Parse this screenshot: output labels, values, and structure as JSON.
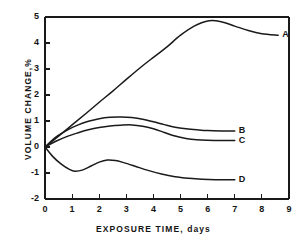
{
  "chart_data": {
    "type": "line",
    "title": "",
    "xlabel": "EXPOSURE TIME, days",
    "ylabel": "VOLUME CHANGE,%",
    "xlim": [
      0,
      9
    ],
    "ylim": [
      -2,
      5
    ],
    "xticks": [
      "0",
      "1",
      "2",
      "3",
      "4",
      "5",
      "6",
      "7",
      "8",
      "9"
    ],
    "yticks": [
      "-2",
      "-1",
      "0",
      "1",
      "2",
      "3",
      "4",
      "5"
    ],
    "grid": false,
    "legend_position": "inline-right-end-labels",
    "line_color": "#1a1a1a",
    "axis_color": "#1a1a1a",
    "series": [
      {
        "name": "A",
        "label": "A",
        "x": [
          0,
          0.5,
          1,
          1.5,
          2,
          2.5,
          3,
          3.5,
          4,
          4.5,
          5,
          5.5,
          6,
          6.5,
          7,
          7.5,
          8,
          8.6
        ],
        "values": [
          0,
          0.42,
          0.85,
          1.28,
          1.72,
          2.15,
          2.6,
          3.04,
          3.45,
          3.85,
          4.3,
          4.65,
          4.85,
          4.82,
          4.65,
          4.48,
          4.36,
          4.3
        ]
      },
      {
        "name": "B",
        "label": "B",
        "x": [
          0,
          0.4,
          0.8,
          1.2,
          1.6,
          2,
          2.4,
          2.8,
          3.2,
          3.6,
          4,
          4.4,
          4.8,
          5.2,
          5.6,
          6,
          6.5,
          7
        ],
        "values": [
          0,
          0.38,
          0.64,
          0.84,
          0.99,
          1.09,
          1.14,
          1.15,
          1.13,
          1.07,
          0.97,
          0.86,
          0.76,
          0.7,
          0.66,
          0.63,
          0.62,
          0.62
        ]
      },
      {
        "name": "C",
        "label": "C",
        "x": [
          0,
          0.4,
          0.8,
          1.2,
          1.6,
          2,
          2.4,
          2.8,
          3.2,
          3.6,
          4,
          4.4,
          4.8,
          5.2,
          5.6,
          6,
          6.5,
          7
        ],
        "values": [
          0,
          0.22,
          0.4,
          0.54,
          0.66,
          0.75,
          0.81,
          0.84,
          0.85,
          0.8,
          0.7,
          0.56,
          0.42,
          0.33,
          0.28,
          0.26,
          0.25,
          0.25
        ]
      },
      {
        "name": "D",
        "label": "D",
        "x": [
          0,
          0.3,
          0.6,
          0.9,
          1.1,
          1.4,
          1.7,
          2,
          2.3,
          2.6,
          2.9,
          3.3,
          3.8,
          4.3,
          4.8,
          5.3,
          5.8,
          6.3,
          6.7,
          7
        ],
        "values": [
          0,
          -0.38,
          -0.66,
          -0.86,
          -0.93,
          -0.88,
          -0.73,
          -0.58,
          -0.5,
          -0.52,
          -0.6,
          -0.73,
          -0.9,
          -1.04,
          -1.14,
          -1.2,
          -1.24,
          -1.26,
          -1.26,
          -1.26
        ]
      }
    ]
  }
}
